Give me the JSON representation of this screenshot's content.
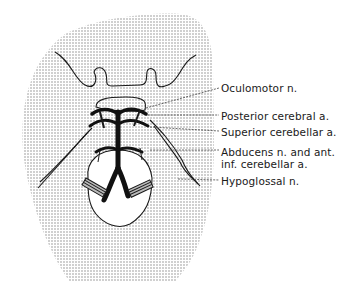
{
  "diagram": {
    "type": "anatomical illustration",
    "labels": [
      {
        "id": "oculomotor",
        "text": "Oculomotor n."
      },
      {
        "id": "posterior-cerebral",
        "text": "Posterior cerebral a."
      },
      {
        "id": "superior-cerebellar",
        "text": "Superior cerebellar a."
      },
      {
        "id": "abducens-line1",
        "text": "Abducens n. and ant."
      },
      {
        "id": "abducens-line2",
        "text": "inf. cerebellar a."
      },
      {
        "id": "hypoglossal",
        "text": "Hypoglossal n."
      }
    ],
    "colors": {
      "stipple": "#8a8a8a",
      "ink": "#1a1a1a",
      "background": "#ffffff"
    }
  }
}
